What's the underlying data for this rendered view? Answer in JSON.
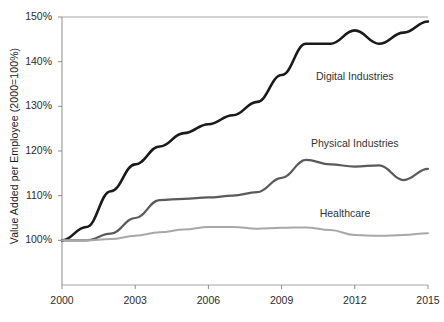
{
  "chart_data": {
    "type": "line",
    "title": "",
    "xlabel": "",
    "ylabel": "Value Added per Employee (2000=100%)",
    "x": [
      2000,
      2001,
      2002,
      2003,
      2004,
      2005,
      2006,
      2007,
      2008,
      2009,
      2010,
      2011,
      2012,
      2013,
      2014,
      2015
    ],
    "xlim": [
      2000,
      2015
    ],
    "ylim": [
      90,
      150
    ],
    "xticks": [
      2000,
      2003,
      2006,
      2009,
      2012,
      2015
    ],
    "xtick_labels": [
      "2000",
      "2003",
      "2006",
      "2009",
      "2012",
      "2015"
    ],
    "yticks": [
      100,
      110,
      120,
      130,
      140,
      150
    ],
    "ytick_labels": [
      "100%",
      "110%",
      "120%",
      "130%",
      "140%",
      "150%"
    ],
    "grid": false,
    "legend_position": "inline-right",
    "series": [
      {
        "name": "Digital Industries",
        "color": "#1a1a1a",
        "width": 2.6,
        "values": [
          100,
          103,
          111,
          117,
          121,
          124,
          126,
          128,
          131,
          137,
          144,
          144,
          147,
          144,
          146.5,
          149
        ],
        "label_x": 2012.0,
        "label_y": 136.5
      },
      {
        "name": "Physical Industries",
        "color": "#5a5a5a",
        "width": 2.2,
        "values": [
          100,
          100,
          101.5,
          105,
          109,
          109.3,
          109.6,
          110,
          110.8,
          114,
          118,
          117,
          116.5,
          116.8,
          113.5,
          116
        ],
        "label_x": 2012.0,
        "label_y": 121.5
      },
      {
        "name": "Healthcare",
        "color": "#a8a8a8",
        "width": 2.0,
        "values": [
          100,
          100,
          100.3,
          101,
          101.8,
          102.4,
          103,
          103,
          102.6,
          102.8,
          102.9,
          102.3,
          101.2,
          101,
          101.2,
          101.6
        ],
        "label_x": 2011.6,
        "label_y": 106.0
      }
    ]
  },
  "axes": {
    "axis_color": "#8c8c8c",
    "top_border_color": "#a5a5a5",
    "background": "#ffffff"
  }
}
